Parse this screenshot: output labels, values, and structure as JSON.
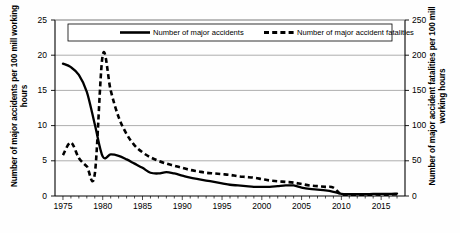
{
  "chart_data": {
    "type": "line",
    "title": "",
    "xlabel": "",
    "ylabel": "Number of major accidents per 100 mill working hours",
    "y2label": "Number of major accident fatalities per 100 mill working hours",
    "xlim": [
      1974,
      2018
    ],
    "ylim": [
      0,
      25
    ],
    "y2lim": [
      0,
      250
    ],
    "grid": true,
    "legend_position": "top-inside",
    "x_ticks": [
      1975,
      1980,
      1985,
      1990,
      1995,
      2000,
      2005,
      2010,
      2015
    ],
    "x_tick_labels": [
      "1975",
      "1980",
      "1985",
      "1990",
      "1995",
      "2000",
      "2005",
      "2010",
      "2015"
    ],
    "x_minor_tick_step": 1,
    "y_ticks": [
      0,
      5,
      10,
      15,
      20,
      25
    ],
    "y_tick_labels": [
      "0",
      "5",
      "10",
      "15",
      "20",
      "25"
    ],
    "y2_ticks": [
      0,
      50,
      100,
      150,
      200,
      250
    ],
    "y2_tick_labels": [
      "0",
      "50",
      "100",
      "150",
      "200",
      "250"
    ],
    "series": [
      {
        "name": "Number of major accidents",
        "axis": "left",
        "style": "solid",
        "color": "#000000",
        "x": [
          1975,
          1976,
          1977,
          1978,
          1979,
          1980,
          1981,
          1982,
          1983,
          1984,
          1985,
          1986,
          1987,
          1988,
          1989,
          1990,
          1991,
          1992,
          1993,
          1994,
          1995,
          1996,
          1997,
          1998,
          1999,
          2000,
          2001,
          2002,
          2003,
          2004,
          2005,
          2006,
          2007,
          2008,
          2009,
          2010,
          2011,
          2012,
          2013,
          2014,
          2015,
          2016,
          2017
        ],
        "values": [
          18.8,
          18.3,
          17.2,
          14.8,
          10.2,
          5.6,
          5.9,
          5.7,
          5.2,
          4.6,
          4.0,
          3.3,
          3.2,
          3.4,
          3.2,
          2.9,
          2.6,
          2.4,
          2.2,
          2.0,
          1.8,
          1.6,
          1.5,
          1.4,
          1.3,
          1.3,
          1.3,
          1.4,
          1.5,
          1.5,
          1.2,
          1.0,
          0.9,
          0.8,
          0.6,
          0.3,
          0.25,
          0.25,
          0.25,
          0.3,
          0.3,
          0.3,
          0.35
        ]
      },
      {
        "name": "Number of major accident fatalities",
        "axis": "right",
        "style": "dashed",
        "color": "#000000",
        "x": [
          1975,
          1976,
          1977,
          1978,
          1979,
          1980,
          1981,
          1982,
          1983,
          1984,
          1985,
          1986,
          1987,
          1988,
          1989,
          1990,
          1991,
          1992,
          1993,
          1994,
          1995,
          1996,
          1997,
          1998,
          1999,
          2000,
          2001,
          2002,
          2003,
          2004,
          2005,
          2006,
          2007,
          2008,
          2009,
          2010,
          2011,
          2012,
          2013,
          2014,
          2015,
          2016,
          2017
        ],
        "values": [
          58,
          76,
          54,
          42,
          31,
          200,
          150,
          112,
          88,
          72,
          62,
          55,
          50,
          46,
          43,
          40,
          37,
          35,
          33,
          32,
          31,
          30,
          28,
          27,
          26,
          24,
          22,
          21,
          20,
          19,
          17,
          15,
          14,
          13,
          12,
          2,
          1.5,
          1.5,
          1.5,
          2,
          2,
          2,
          2.5
        ]
      }
    ]
  },
  "legend": {
    "entries": [
      {
        "label": "Number of major accidents",
        "style": "solid"
      },
      {
        "label": "Number of major accident fatalities",
        "style": "dashed"
      }
    ]
  }
}
